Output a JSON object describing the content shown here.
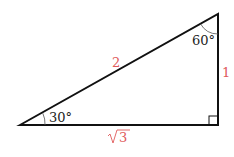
{
  "diagram": {
    "type": "right-triangle",
    "colors": {
      "line": "#111111",
      "side_label": "#e05a5a",
      "angle_label": "#222222"
    },
    "sides": {
      "hypotenuse": "2",
      "vertical": "1",
      "base_radicand": "3"
    },
    "angles": {
      "bottom_left": "30°",
      "top_right": "60°",
      "bottom_right": "right-angle"
    }
  }
}
